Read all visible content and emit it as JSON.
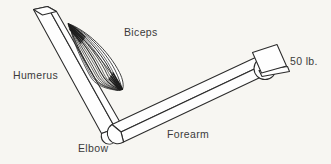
{
  "figure": {
    "background_color": "#f7f6f2",
    "ink_color": "#2b2b2b",
    "label_color": "#3b3b3b",
    "bone_fill": "#fefefe",
    "muscle_fill": "#ffffff"
  },
  "labels": {
    "humerus": "Humerus",
    "biceps": "Biceps",
    "elbow": "Elbow",
    "forearm": "Forearm",
    "weight": "50 lb."
  },
  "parts": {
    "humerus": {
      "name": "humerus-bone",
      "description": "upper arm bone drawn as a three-dimensional rectangular bar"
    },
    "biceps": {
      "name": "biceps-muscle",
      "description": "fusiform striated muscle spanning humerus to forearm",
      "fiber_count": 13
    },
    "elbow": {
      "name": "elbow-joint",
      "description": "rounded distal end of the humerus forming the pivot"
    },
    "forearm": {
      "name": "forearm-bone",
      "description": "forearm drawn as a three-dimensional rectangular bar"
    },
    "hand": {
      "name": "hand-fist",
      "description": "circular fist gripping the weight"
    },
    "weight": {
      "name": "weight-block",
      "description": "tilted square block resting on a small platform",
      "value": "50 lb."
    }
  }
}
